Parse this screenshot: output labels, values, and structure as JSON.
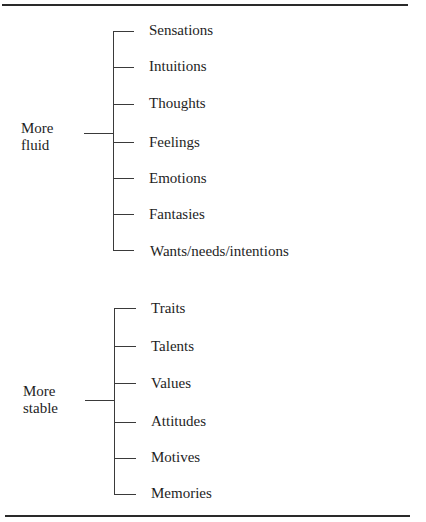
{
  "groups": [
    {
      "label_line1": "More",
      "label_line2": "fluid",
      "items": [
        "Sensations",
        "Intuitions",
        "Thoughts",
        "Feelings",
        "Emotions",
        "Fantasies",
        "Wants/needs/intentions"
      ]
    },
    {
      "label_line1": "More",
      "label_line2": "stable",
      "items": [
        "Traits",
        "Talents",
        "Values",
        "Attitudes",
        "Motives",
        "Memories"
      ]
    }
  ]
}
